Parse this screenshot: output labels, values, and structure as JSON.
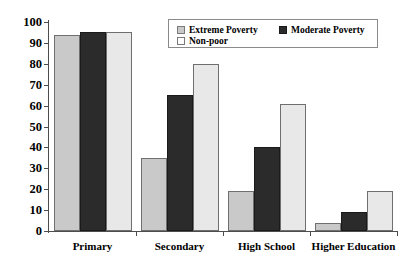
{
  "chart_data": {
    "type": "bar",
    "title": "",
    "xlabel": "",
    "ylabel": "",
    "ylim": [
      0,
      100
    ],
    "ytick_step": 10,
    "grid": false,
    "legend_position": "top-right-inside",
    "categories": [
      "Primary",
      "Secondary",
      "High School",
      "Higher Education"
    ],
    "series": [
      {
        "name": "Extreme Poverty",
        "color": "#c9c9c9",
        "values": [
          94,
          35,
          19,
          4
        ]
      },
      {
        "name": "Moderate Poverty",
        "color": "#2b2b2b",
        "values": [
          95,
          65,
          40,
          9
        ]
      },
      {
        "name": "Non-poor",
        "color": "#e8e8e8",
        "values": [
          95,
          80,
          61,
          19
        ]
      }
    ],
    "ytick_labels": [
      "0",
      "10",
      "20",
      "30",
      "40",
      "50",
      "60",
      "70",
      "80",
      "90",
      "100"
    ]
  }
}
